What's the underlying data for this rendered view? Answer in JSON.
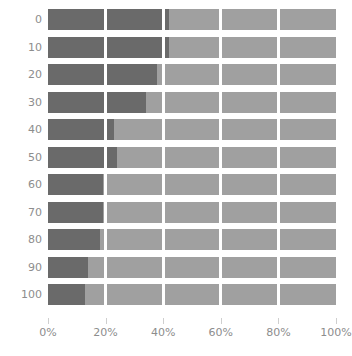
{
  "chart_data": {
    "type": "bar",
    "orientation": "horizontal",
    "stacked": true,
    "stack_mode": "percent",
    "title": "",
    "xlabel": "",
    "ylabel": "",
    "xlim": [
      0,
      100
    ],
    "grid": true,
    "grid_axis": "x",
    "legend_position": "none",
    "categories": [
      "0",
      "10",
      "20",
      "30",
      "40",
      "50",
      "60",
      "70",
      "80",
      "90",
      "100"
    ],
    "xtick_labels": [
      "0%",
      "20%",
      "40%",
      "60%",
      "80%",
      "100%"
    ],
    "xtick_values": [
      0,
      20,
      40,
      60,
      80,
      100
    ],
    "series": [
      {
        "name": "dark",
        "color": "#6a6a6a",
        "values": [
          42,
          42,
          38,
          34,
          23,
          24,
          19,
          19,
          18,
          14,
          13
        ]
      },
      {
        "name": "light",
        "color": "#a0a0a0",
        "values": [
          58,
          58,
          62,
          66,
          77,
          76,
          81,
          81,
          82,
          86,
          87
        ]
      }
    ]
  },
  "colors": {
    "dark_segment": "#6a6a6a",
    "light_segment": "#a0a0a0",
    "gridline": "#ffffff",
    "axis_text": "#8d8d8d",
    "tick_mark": "#cfcfcf",
    "background": "#ffffff"
  },
  "clipped_top_title": ""
}
